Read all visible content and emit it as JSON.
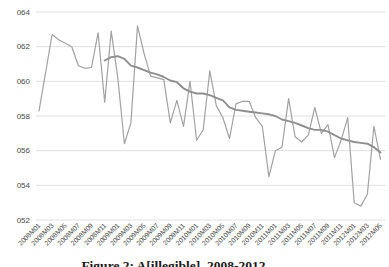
{
  "chart_data": {
    "type": "line",
    "title": "",
    "legend": "none",
    "grid": {
      "horizontal": true,
      "color": "#d9d9d9"
    },
    "y_axis": {
      "min": 52,
      "max": 64,
      "tick_values": [
        64,
        62,
        60,
        58,
        56,
        54,
        52
      ],
      "tick_labels": [
        "064",
        "062",
        "060",
        "058",
        "056",
        "054",
        "052"
      ]
    },
    "x_axis": {
      "tick_labels": [
        "2008M01",
        "2008M03",
        "2008M05",
        "2008M07",
        "2008M09",
        "2008M11",
        "2009M01",
        "2009M03",
        "2009M05",
        "2009M07",
        "2009M09",
        "2009M11",
        "2010M01",
        "2010M03",
        "2010M05",
        "2010M07",
        "2010M09",
        "2010M11",
        "2011M01",
        "2011M03",
        "2011M05",
        "2011M07",
        "2011M09",
        "2011M11",
        "2012M01",
        "2012M03",
        "2012M05"
      ],
      "months": [
        "2008M01",
        "2008M02",
        "2008M03",
        "2008M04",
        "2008M05",
        "2008M06",
        "2008M07",
        "2008M08",
        "2008M09",
        "2008M10",
        "2008M11",
        "2008M12",
        "2009M01",
        "2009M02",
        "2009M03",
        "2009M04",
        "2009M05",
        "2009M06",
        "2009M07",
        "2009M08",
        "2009M09",
        "2009M10",
        "2009M11",
        "2009M12",
        "2010M01",
        "2010M02",
        "2010M03",
        "2010M04",
        "2010M05",
        "2010M06",
        "2010M07",
        "2010M08",
        "2010M09",
        "2010M10",
        "2010M11",
        "2010M12",
        "2011M01",
        "2011M02",
        "2011M03",
        "2011M04",
        "2011M05",
        "2011M06",
        "2011M07",
        "2011M08",
        "2011M09",
        "2011M10",
        "2011M11",
        "2011M12",
        "2012M01",
        "2012M02",
        "2012M03",
        "2012M04",
        "2012M05"
      ]
    },
    "series": [
      {
        "name": "monthly-values",
        "color": "#a2a2a2",
        "stroke_width": 1.2,
        "values": [
          58.3,
          60.5,
          62.7,
          62.4,
          62.2,
          62.0,
          60.9,
          60.75,
          60.8,
          62.8,
          58.8,
          62.9,
          60.2,
          56.4,
          57.6,
          63.2,
          61.6,
          60.3,
          60.2,
          60.1,
          57.6,
          58.9,
          57.4,
          60.0,
          56.6,
          57.2,
          60.6,
          58.6,
          57.9,
          56.7,
          58.7,
          58.85,
          58.85,
          57.9,
          57.4,
          54.5,
          56.0,
          56.2,
          59.0,
          56.8,
          56.5,
          56.9,
          58.5,
          57.0,
          57.5,
          55.6,
          56.6,
          57.9,
          53.0,
          52.8,
          53.5,
          57.4,
          55.5
        ]
      },
      {
        "name": "smoothed-trend",
        "color": "#8f8f8f",
        "stroke_width": 1.9,
        "values": [
          null,
          null,
          null,
          null,
          null,
          null,
          null,
          null,
          null,
          null,
          61.2,
          61.4,
          61.45,
          61.3,
          60.9,
          60.8,
          60.65,
          60.5,
          60.4,
          60.25,
          60.05,
          59.95,
          59.6,
          59.4,
          59.3,
          59.3,
          59.2,
          59.05,
          58.9,
          58.5,
          58.35,
          58.3,
          58.25,
          58.2,
          58.15,
          58.1,
          58.0,
          57.8,
          57.7,
          57.6,
          57.45,
          57.3,
          57.2,
          57.2,
          57.1,
          56.9,
          56.7,
          56.6,
          56.5,
          56.45,
          56.4,
          56.2,
          55.9
        ]
      }
    ]
  },
  "caption": {
    "text": "Figure 2: A[illegible], 2008-2012"
  }
}
